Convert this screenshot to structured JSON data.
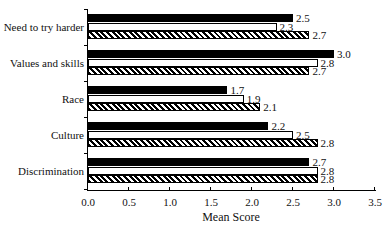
{
  "chart_data": {
    "type": "bar",
    "orientation": "horizontal",
    "title": "",
    "xlabel": "Mean Score",
    "ylabel": "",
    "xlim": [
      0.0,
      3.5
    ],
    "x_ticks": [
      "0.0",
      "0.5",
      "1.0",
      "1.5",
      "2.0",
      "2.5",
      "3.0",
      "3.5"
    ],
    "grid": false,
    "legend": null,
    "categories": [
      "Need to try harder",
      "Values and skills",
      "Race",
      "Culture",
      "Discrimination"
    ],
    "series": [
      {
        "name": "Series 1 (solid black)",
        "values": [
          2.5,
          3.0,
          1.7,
          2.2,
          2.7
        ]
      },
      {
        "name": "Series 2 (white)",
        "values": [
          2.3,
          2.8,
          1.9,
          2.5,
          2.8
        ]
      },
      {
        "name": "Series 3 (hatched)",
        "values": [
          2.7,
          2.7,
          2.1,
          2.8,
          2.8
        ]
      }
    ],
    "value_labels": [
      [
        "2.5",
        "2.3",
        "2.7"
      ],
      [
        "3.0",
        "2.8",
        "2.7"
      ],
      [
        "1.7",
        "1.9",
        "2.1"
      ],
      [
        "2.2",
        "2.5",
        "2.8"
      ],
      [
        "2.7",
        "2.8",
        "2.8"
      ]
    ]
  }
}
